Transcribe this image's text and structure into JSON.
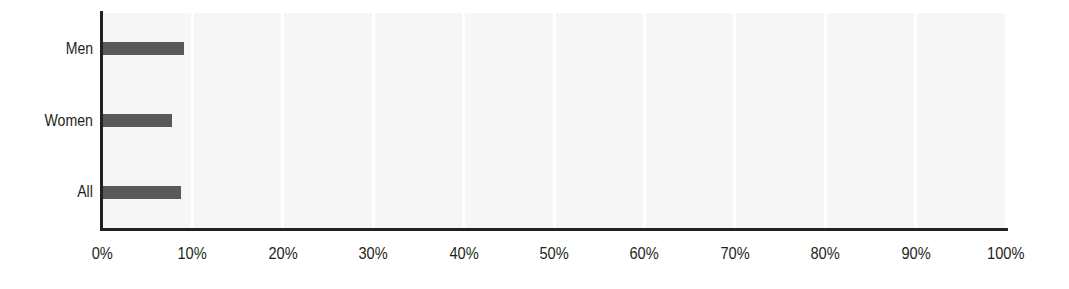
{
  "chart_data": {
    "type": "bar",
    "orientation": "horizontal",
    "title": "",
    "subtitle": "",
    "xlabel": "",
    "ylabel": "",
    "categories": [
      "Men",
      "Women",
      "All"
    ],
    "values": [
      9.1,
      7.7,
      8.7
    ],
    "value_unit": "%",
    "xlim": [
      0,
      100
    ],
    "x_ticks": [
      0,
      10,
      20,
      30,
      40,
      50,
      60,
      70,
      80,
      90,
      100
    ],
    "x_tick_labels": [
      "0%",
      "10%",
      "20%",
      "30%",
      "40%",
      "50%",
      "60%",
      "70%",
      "80%",
      "90%",
      "100%"
    ],
    "grid": true,
    "grid_orientation": "vertical",
    "grid_color": "#ffffff",
    "legend": false,
    "legend_position": "none",
    "series": [
      {
        "name": "",
        "color": "#595959",
        "values": [
          9.1,
          7.7,
          8.7
        ]
      }
    ],
    "annotations": []
  },
  "style": {
    "plot_background": "#f6f6f6",
    "page_background": "#ffffff",
    "axis_color": "#231f20",
    "bar_color": "#595959",
    "gridline_color": "#ffffff",
    "tick_label_color": "#231f20"
  },
  "axes": {
    "y_labels": [
      {
        "label": "Men"
      },
      {
        "label": "Women"
      },
      {
        "label": "All"
      }
    ],
    "x_labels": [
      {
        "label": "0%"
      },
      {
        "label": "10%"
      },
      {
        "label": "20%"
      },
      {
        "label": "30%"
      },
      {
        "label": "40%"
      },
      {
        "label": "50%"
      },
      {
        "label": "60%"
      },
      {
        "label": "70%"
      },
      {
        "label": "80%"
      },
      {
        "label": "90%"
      },
      {
        "label": "100%"
      }
    ]
  }
}
